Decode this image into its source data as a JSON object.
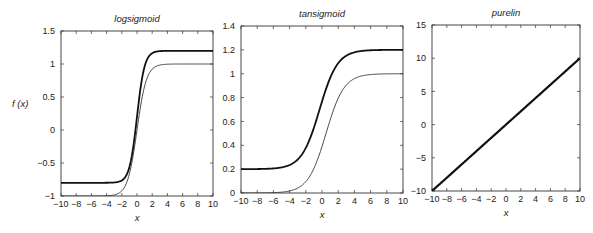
{
  "figure": {
    "ylabel": "f (x)"
  },
  "chart_data": [
    {
      "type": "line",
      "title": "logsigmoid",
      "xlabel": "x",
      "ylabel": "f (x)",
      "xlim": [
        -10,
        10
      ],
      "ylim": [
        -1,
        1.5
      ],
      "xticks": [
        -10,
        -8,
        -6,
        -4,
        -2,
        0,
        2,
        4,
        6,
        8,
        10
      ],
      "yticks": [
        -1,
        -0.5,
        0,
        0.5,
        1,
        1.5
      ],
      "ytick_labels": [
        "-1",
        "-0.5",
        "0",
        "0.5",
        "1",
        "1.5"
      ],
      "grid": false,
      "box": [
        61,
        31,
        213,
        196
      ],
      "series": [
        {
          "name": "thick",
          "func": "logsig",
          "scale": 2.0,
          "offset": -0.8,
          "gain": 2.0,
          "width": 1.8,
          "color": "#111111"
        },
        {
          "name": "thin",
          "func": "logsig",
          "scale": 2.0,
          "offset": -1.0,
          "gain": 1.6,
          "width": 0.9,
          "color": "#333333"
        }
      ]
    },
    {
      "type": "line",
      "title": "tansigmoid",
      "xlabel": "x",
      "xlim": [
        -10,
        10
      ],
      "ylim": [
        0,
        1.4
      ],
      "xticks": [
        -10,
        -8,
        -6,
        -4,
        -2,
        0,
        2,
        4,
        6,
        8,
        10
      ],
      "yticks": [
        0,
        0.2,
        0.4,
        0.6,
        0.8,
        1,
        1.2,
        1.4
      ],
      "ytick_labels": [
        "0",
        "0.2",
        "0.4",
        "0.6",
        "0.8",
        "1",
        "1.2",
        "1.4"
      ],
      "grid": false,
      "box": [
        241,
        26,
        403,
        193
      ],
      "series": [
        {
          "name": "thick",
          "func": "logsig",
          "scale": 1.0,
          "offset": 0.2,
          "gain": 0.9,
          "shift": -0.3,
          "width": 1.8,
          "color": "#111111"
        },
        {
          "name": "thin",
          "func": "logsig",
          "scale": 1.0,
          "offset": 0.0,
          "gain": 0.9,
          "shift": 0.5,
          "width": 0.9,
          "color": "#333333"
        }
      ]
    },
    {
      "type": "line",
      "title": "purelin",
      "xlabel": "x",
      "xlim": [
        -10,
        10
      ],
      "ylim": [
        -10,
        15
      ],
      "xticks": [
        -10,
        -8,
        -6,
        -4,
        -2,
        0,
        2,
        4,
        6,
        8,
        10
      ],
      "yticks": [
        -10,
        -5,
        0,
        5,
        10,
        15
      ],
      "ytick_labels": [
        "-10",
        "-5",
        "0",
        "5",
        "10",
        "15"
      ],
      "grid": false,
      "box": [
        432,
        25,
        580,
        191
      ],
      "series": [
        {
          "name": "thick",
          "func": "linear",
          "slope": 1.0,
          "offset": 0.0,
          "width": 2.2,
          "color": "#111111"
        }
      ]
    }
  ]
}
